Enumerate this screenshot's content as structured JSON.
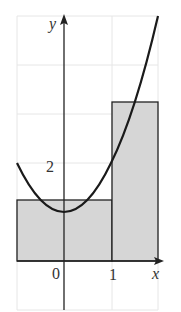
{
  "diagram": {
    "type": "riemann-sum",
    "function": "y = x^2 + 1",
    "axes": {
      "x_label": "x",
      "y_label": "y"
    },
    "tick_labels": {
      "origin": "0",
      "x_one": "1",
      "y_two": "2"
    },
    "rectangles": [
      {
        "x_from": -1,
        "x_to": 1,
        "height": 1.25
      },
      {
        "x_from": 1,
        "x_to": 2,
        "height": 3.25
      }
    ],
    "x_range": [
      -1,
      2
    ],
    "y_range": [
      -1,
      5
    ],
    "grid": true,
    "colors": {
      "fill": "#d6d6d6",
      "curve": "#1a1a1a",
      "grid": "#e6e6e6"
    }
  }
}
